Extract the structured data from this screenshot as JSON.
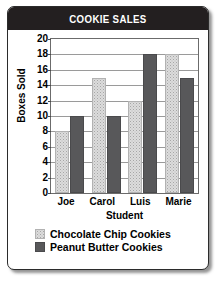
{
  "chart_data": {
    "type": "bar",
    "title": "COOKIE SALES",
    "xlabel": "Student",
    "ylabel": "Boxes Sold",
    "categories": [
      "Joe",
      "Carol",
      "Luis",
      "Marie"
    ],
    "series": [
      {
        "name": "Chocolate Chip Cookies",
        "color": "#dcdcdc",
        "values": [
          8,
          15,
          12,
          18
        ]
      },
      {
        "name": "Peanut Butter Cookies",
        "color": "#58585a",
        "values": [
          10,
          10,
          18,
          15
        ]
      }
    ],
    "ylim": [
      0,
      20
    ],
    "yticks": [
      0,
      2,
      4,
      6,
      8,
      10,
      12,
      14,
      16,
      18,
      20
    ],
    "grid": true,
    "legend_position": "bottom"
  },
  "style": {
    "title_bg": "#231f20",
    "title_fg": "#ffffff",
    "card_bg": "#ffffff",
    "card_border": "#2b2b2b",
    "grid_color": "#9a9a9a"
  }
}
